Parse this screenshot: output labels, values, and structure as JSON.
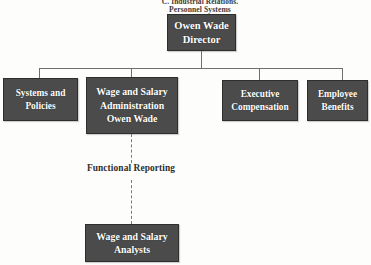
{
  "diagram": {
    "type": "organizational-chart",
    "caption": {
      "line1": "C. Industrial Relations.",
      "line2": "Personnel Systems"
    },
    "colors": {
      "box_fill": "#4b4b4b",
      "box_border": "#2e2e2e",
      "box_text": "#ffffff",
      "connector": "#6e6e6e",
      "background": "#fdfdfc",
      "label_text": "#2e2e2e"
    },
    "nodes": {
      "root": {
        "lines": [
          "Owen Wade",
          "Director"
        ]
      },
      "systems": {
        "lines": [
          "Systems and",
          "Policies"
        ]
      },
      "wage": {
        "lines": [
          "Wage and Salary",
          "Administration",
          "Owen Wade"
        ]
      },
      "executive": {
        "lines": [
          "Executive",
          "Compensation"
        ]
      },
      "benefits": {
        "lines": [
          "Employee",
          "Benefits"
        ]
      },
      "analysts": {
        "lines": [
          "Wage and Salary",
          "Analysts"
        ]
      }
    },
    "labels": {
      "functional_reporting": "Functional Reporting"
    }
  }
}
